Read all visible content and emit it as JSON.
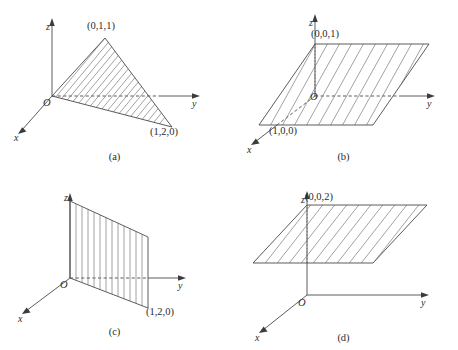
{
  "figure": {
    "panels": [
      {
        "id": "a",
        "caption": "(a)",
        "axes": {
          "x": "x",
          "y": "y",
          "z": "z"
        },
        "origin": "O",
        "point_labels": [
          "(0,1,1)",
          "(1,2,0)"
        ],
        "shape": "triangle",
        "hatch": "diagonal"
      },
      {
        "id": "b",
        "caption": "(b)",
        "axes": {
          "x": "x",
          "y": "y",
          "z": "z"
        },
        "origin": "O",
        "point_labels": [
          "(0,0,1)",
          "(1,0,0)"
        ],
        "shape": "parallelogram",
        "hatch": "diagonal"
      },
      {
        "id": "c",
        "caption": "(c)",
        "axes": {
          "x": "x",
          "y": "y",
          "z": "z"
        },
        "origin": "O",
        "point_labels": [
          "(1,2,0)"
        ],
        "shape": "quadrilateral",
        "hatch": "vertical"
      },
      {
        "id": "d",
        "caption": "(d)",
        "axes": {
          "x": "x",
          "y": "y",
          "z": "z"
        },
        "origin": "O",
        "point_labels": [
          "(0,0,2)"
        ],
        "shape": "parallelogram",
        "hatch": "diagonal"
      }
    ],
    "colors": {
      "stroke": "#4a4a4a",
      "hatch": "#6f6f6f",
      "text": "#2b2b2b",
      "background": "#ffffff"
    }
  }
}
